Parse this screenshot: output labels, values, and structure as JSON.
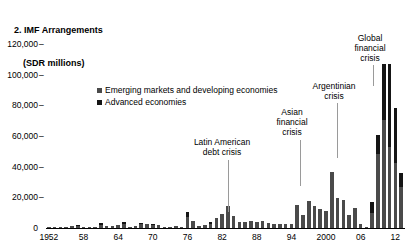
{
  "title": {
    "line1": "2. IMF Arrangements",
    "line2": "(SDR millions)"
  },
  "legend": {
    "items": [
      {
        "label": "Emerging markets and developing economies",
        "color": "#4a4a4a",
        "key": "emerging"
      },
      {
        "label": "Advanced economies",
        "color": "#151515",
        "key": "advanced"
      }
    ]
  },
  "annotations": [
    {
      "name": "latin-american-debt-crisis",
      "text": "Latin American\ndebt crisis",
      "x": 222,
      "y": 137,
      "leader_x": 228,
      "leader_top": 160,
      "leader_bottom": 212
    },
    {
      "name": "asian-financial-crisis",
      "text": "Asian\nfinancial\ncrisis",
      "x": 292,
      "y": 107,
      "leader_x": 300,
      "leader_top": 140,
      "leader_bottom": 186
    },
    {
      "name": "argentinian-crisis",
      "text": "Argentinian\ncrisis",
      "x": 334,
      "y": 81,
      "leader_x": 337,
      "leader_top": 103,
      "leader_bottom": 158
    },
    {
      "name": "global-financial-crisis",
      "text": "Global\nfinancial\ncrisis",
      "x": 370,
      "y": 33,
      "leader_x": 373,
      "leader_top": 65,
      "leader_bottom": 86
    }
  ],
  "chart_data": {
    "type": "bar",
    "stacked": true,
    "title": "2. IMF Arrangements (SDR millions)",
    "xlabel": "",
    "ylabel": "",
    "ylim": [
      0,
      120000
    ],
    "ytick_values": [
      0,
      20000,
      40000,
      60000,
      80000,
      100000,
      120000
    ],
    "ytick_labels": [
      "0",
      "20,000",
      "40,000",
      "60,000",
      "80,000",
      "100,000",
      "120,000"
    ],
    "grid": false,
    "legend_position": "upper-left-inside",
    "x_start_year": 1952,
    "x_end_year": 2013,
    "xtick_years": [
      1952,
      1958,
      1964,
      1970,
      1976,
      1982,
      1988,
      1994,
      2000,
      2006,
      2012
    ],
    "xtick_labels": [
      "1952",
      "58",
      "64",
      "70",
      "76",
      "82",
      "88",
      "94",
      "2000",
      "06",
      "12"
    ],
    "years": [
      1952,
      1953,
      1954,
      1955,
      1956,
      1957,
      1958,
      1959,
      1960,
      1961,
      1962,
      1963,
      1964,
      1965,
      1966,
      1967,
      1968,
      1969,
      1970,
      1971,
      1972,
      1973,
      1974,
      1975,
      1976,
      1977,
      1978,
      1979,
      1980,
      1981,
      1982,
      1983,
      1984,
      1985,
      1986,
      1987,
      1988,
      1989,
      1990,
      1991,
      1992,
      1993,
      1994,
      1995,
      1996,
      1997,
      1998,
      1999,
      2000,
      2001,
      2002,
      2003,
      2004,
      2005,
      2006,
      2007,
      2008,
      2009,
      2010,
      2011,
      2012,
      2013
    ],
    "series": [
      {
        "name": "Emerging markets and developing economies",
        "color": "#4a4a4a",
        "values": [
          30,
          55,
          62,
          70,
          1150,
          1120,
          940,
          310,
          360,
          2100,
          1500,
          1350,
          2050,
          2400,
          600,
          1150,
          2300,
          2500,
          2050,
          1900,
          300,
          320,
          1100,
          390,
          6900,
          4600,
          1200,
          1900,
          2800,
          6400,
          8900,
          14200,
          8100,
          4000,
          4200,
          4500,
          4100,
          4300,
          3100,
          2900,
          2400,
          2300,
          2600,
          14800,
          8600,
          17400,
          14100,
          12100,
          11400,
          36500,
          19400,
          18200,
          8300,
          13000,
          2400,
          600,
          9500,
          48000,
          70500,
          53000,
          42500,
          26500
        ]
      },
      {
        "name": "Advanced economies",
        "color": "#151515",
        "values": [
          0,
          0,
          0,
          0,
          0,
          600,
          0,
          0,
          0,
          1200,
          0,
          0,
          0,
          1400,
          0,
          0,
          900,
          0,
          200,
          0,
          0,
          0,
          0,
          0,
          3800,
          0,
          0,
          0,
          1200,
          0,
          0,
          0,
          0,
          0,
          0,
          0,
          0,
          0,
          0,
          0,
          0,
          0,
          0,
          0,
          0,
          0,
          0,
          0,
          0,
          0,
          0,
          0,
          0,
          0,
          0,
          0,
          7500,
          12500,
          36500,
          54000,
          35500,
          9500
        ]
      }
    ]
  }
}
